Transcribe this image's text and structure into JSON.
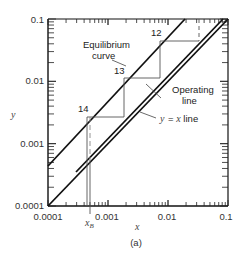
{
  "chart_data": {
    "type": "line",
    "title": "",
    "xlabel": "x",
    "ylabel": "y",
    "caption": "(a)",
    "xscale": "log",
    "yscale": "log",
    "xlim": [
      0.0001,
      0.1
    ],
    "ylim": [
      0.0001,
      0.1
    ],
    "x_ticks": [
      "0.0001",
      "0.001",
      "0.01",
      "0.1"
    ],
    "y_ticks": [
      "0.0001",
      "0.001",
      "0.01",
      "0.1"
    ],
    "grid": false,
    "series": [
      {
        "name": "Equilibrium curve",
        "x": [
          0.0001,
          0.0158
        ],
        "y": [
          0.00071,
          0.1
        ]
      },
      {
        "name": "Operating line",
        "x": [
          0.00055,
          0.1
        ],
        "y": [
          0.00055,
          0.1
        ]
      },
      {
        "name": "y = x line",
        "x": [
          0.0001,
          0.1
        ],
        "y": [
          0.0001,
          0.1
        ]
      }
    ],
    "stages": [
      {
        "label": "12",
        "x_eq": 0.0078,
        "y": 0.05,
        "x_op": 0.03
      },
      {
        "label": "13",
        "x_eq": 0.0019,
        "y": 0.008,
        "x_op": 0.0078
      },
      {
        "label": "14",
        "x_eq": 0.00059,
        "y": 0.0026,
        "x_op": 0.0019
      }
    ],
    "annotations": [
      "Equilibrium curve",
      "Operating line",
      "y = x line",
      "12",
      "13",
      "14",
      "x_B"
    ],
    "x_B": 0.00059
  },
  "labels": {
    "equilibrium_line1": "Equilibrium",
    "equilibrium_line2": "curve",
    "operating_line1": "Operating",
    "operating_line2": "line",
    "yx_line": "y = x line",
    "stage12": "12",
    "stage13": "13",
    "stage14": "14",
    "xB_main": "x",
    "xB_sub": "B",
    "xlabel": "x",
    "ylabel": "y",
    "caption": "(a)",
    "xt0": "0.0001",
    "xt1": "0.001",
    "xt2": "0.01",
    "xt3": "0.1",
    "yt0": "0.0001",
    "yt1": "0.001",
    "yt2": "0.01",
    "yt3": "0.1"
  }
}
